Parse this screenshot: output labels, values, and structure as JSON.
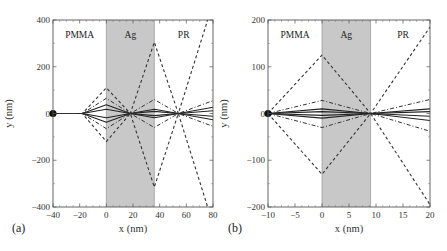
{
  "chart_data": [
    {
      "type": "line",
      "panel_label": "(a)",
      "title": "",
      "xlabel": "x (nm)",
      "ylabel": "y (nm)",
      "xlim": [
        -40,
        80
      ],
      "ylim": [
        -400,
        400
      ],
      "xticks": [
        -40,
        -20,
        0,
        20,
        40,
        60,
        80
      ],
      "xtick_labels": [
        "−40",
        "−20",
        "0",
        "20",
        "40",
        "60",
        "80"
      ],
      "yticks": [
        -400,
        -200,
        0,
        200,
        400
      ],
      "ytick_labels": [
        "−400",
        "−200",
        "0",
        "200",
        "400"
      ],
      "grid": false,
      "band": {
        "label": "Ag",
        "x0": 0,
        "x1": 36,
        "color": "#c8c8c8"
      },
      "regions": [
        {
          "label": "PMMA",
          "x": -20
        },
        {
          "label": "Ag",
          "x": 18
        },
        {
          "label": "PR",
          "x": 58
        }
      ],
      "source_point": {
        "x": -40,
        "y": 0
      },
      "series": [
        {
          "name": "ray-solid-1",
          "style": "solid",
          "x": [
            -40,
            -18,
            0,
            18,
            36,
            54,
            80
          ],
          "y": [
            0,
            0,
            37,
            0,
            18,
            0,
            27
          ]
        },
        {
          "name": "ray-solid-2",
          "style": "solid",
          "x": [
            -40,
            -18,
            0,
            18,
            36,
            54,
            80
          ],
          "y": [
            0,
            0,
            -37,
            0,
            -18,
            0,
            -27
          ]
        },
        {
          "name": "ray-solid-3",
          "style": "solid",
          "x": [
            -40,
            -18,
            0,
            18,
            36,
            54,
            80
          ],
          "y": [
            0,
            0,
            18,
            0,
            9,
            0,
            12
          ]
        },
        {
          "name": "ray-solid-4",
          "style": "solid",
          "x": [
            -40,
            -18,
            0,
            18,
            36,
            54,
            80
          ],
          "y": [
            0,
            0,
            -18,
            0,
            -9,
            0,
            -12
          ]
        },
        {
          "name": "ray-dashdot-1",
          "style": "dashdot",
          "x": [
            -40,
            -18,
            0,
            18,
            36,
            54,
            80
          ],
          "y": [
            0,
            0,
            65,
            0,
            60,
            0,
            55
          ]
        },
        {
          "name": "ray-dashdot-2",
          "style": "dashdot",
          "x": [
            -40,
            -18,
            0,
            18,
            36,
            54,
            80
          ],
          "y": [
            0,
            0,
            -65,
            0,
            -60,
            0,
            -55
          ]
        },
        {
          "name": "ray-dashed-1",
          "style": "dashed",
          "x": [
            -40,
            -18,
            0,
            18,
            36,
            54,
            76
          ],
          "y": [
            0,
            0,
            110,
            0,
            305,
            0,
            400
          ]
        },
        {
          "name": "ray-dashed-2",
          "style": "dashed",
          "x": [
            -40,
            -18,
            0,
            18,
            36,
            54,
            76
          ],
          "y": [
            0,
            0,
            -120,
            0,
            -315,
            0,
            -400
          ]
        }
      ]
    },
    {
      "type": "line",
      "panel_label": "(b)",
      "title": "",
      "xlabel": "x (nm)",
      "ylabel": "y (nm)",
      "xlim": [
        -10,
        20
      ],
      "ylim": [
        -200,
        200
      ],
      "xticks": [
        -10,
        -5,
        0,
        5,
        10,
        15,
        20
      ],
      "xtick_labels": [
        "−10",
        "−5",
        "0",
        "5",
        "10",
        "15",
        "20"
      ],
      "yticks": [
        -200,
        -100,
        0,
        100,
        200
      ],
      "ytick_labels": [
        "−200",
        "−100",
        "0",
        "100",
        "200"
      ],
      "grid": false,
      "band": {
        "label": "Ag",
        "x0": 0,
        "x1": 9,
        "color": "#c8c8c8"
      },
      "regions": [
        {
          "label": "PMMA",
          "x": -5
        },
        {
          "label": "Ag",
          "x": 4.5
        },
        {
          "label": "PR",
          "x": 15
        }
      ],
      "source_point": {
        "x": -10,
        "y": 0
      },
      "series": [
        {
          "name": "ray-solid-1",
          "style": "solid",
          "x": [
            -10,
            0,
            9,
            20
          ],
          "y": [
            0,
            10,
            0,
            10
          ]
        },
        {
          "name": "ray-solid-2",
          "style": "solid",
          "x": [
            -10,
            0,
            9,
            20
          ],
          "y": [
            0,
            -10,
            0,
            -15
          ]
        },
        {
          "name": "ray-solid-3",
          "style": "solid",
          "x": [
            -10,
            0,
            9,
            20
          ],
          "y": [
            0,
            4,
            0,
            4
          ]
        },
        {
          "name": "ray-solid-4",
          "style": "solid",
          "x": [
            -10,
            0,
            9,
            20
          ],
          "y": [
            0,
            -4,
            0,
            -6
          ]
        },
        {
          "name": "ray-dashdot-1",
          "style": "dashdot",
          "x": [
            -10,
            0,
            9,
            20
          ],
          "y": [
            0,
            28,
            0,
            30
          ]
        },
        {
          "name": "ray-dashdot-2",
          "style": "dashdot",
          "x": [
            -10,
            0,
            9,
            20
          ],
          "y": [
            0,
            -30,
            0,
            -38
          ]
        },
        {
          "name": "ray-dashed-1",
          "style": "dashed",
          "x": [
            -10,
            0,
            9,
            20
          ],
          "y": [
            0,
            125,
            0,
            185
          ]
        },
        {
          "name": "ray-dashed-2",
          "style": "dashed",
          "x": [
            -10,
            0,
            9,
            20
          ],
          "y": [
            0,
            -130,
            0,
            -195
          ]
        }
      ]
    }
  ]
}
